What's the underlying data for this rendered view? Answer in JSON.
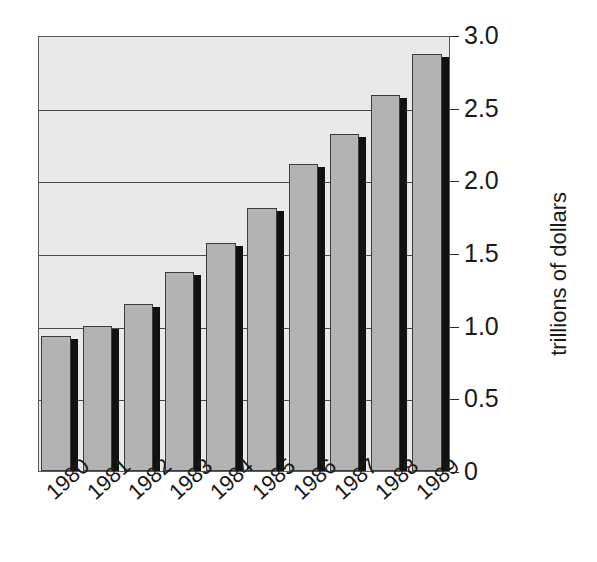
{
  "chart_data": {
    "type": "bar",
    "title": "",
    "xlabel": "",
    "ylabel": "trillions of dollars",
    "categories": [
      "1980",
      "1981",
      "1982",
      "1983",
      "1984",
      "1985",
      "1986",
      "1987",
      "1988",
      "1989"
    ],
    "values": [
      0.93,
      1.0,
      1.15,
      1.37,
      1.57,
      1.81,
      2.11,
      2.32,
      2.59,
      2.87
    ],
    "ylim": [
      0,
      3.0
    ],
    "yticks": [
      0,
      0.5,
      1.0,
      1.5,
      2.0,
      2.5,
      3.0
    ],
    "ytick_labels": [
      "0",
      "0.5",
      "1.0",
      "1.5",
      "2.0",
      "2.5",
      "3.0"
    ],
    "grid": true,
    "gridlines_at": [
      0.5,
      1.0,
      1.5,
      2.0,
      2.5
    ],
    "legend": null,
    "legend_position": "none",
    "annotations": [],
    "xtick_rotation_deg": -42,
    "ylabel_rotation_deg": -90,
    "style": {
      "bar_fill": "#b3b3b3",
      "bar_edge": "#3d3d3d",
      "bar_shadow": "#111111",
      "plot_background": "#e9e9e9",
      "plot_border": "#5b5b5b",
      "gridline_color": "#4a4a4a",
      "text_color": "#1a1a1a",
      "page_background": "#ffffff"
    }
  }
}
